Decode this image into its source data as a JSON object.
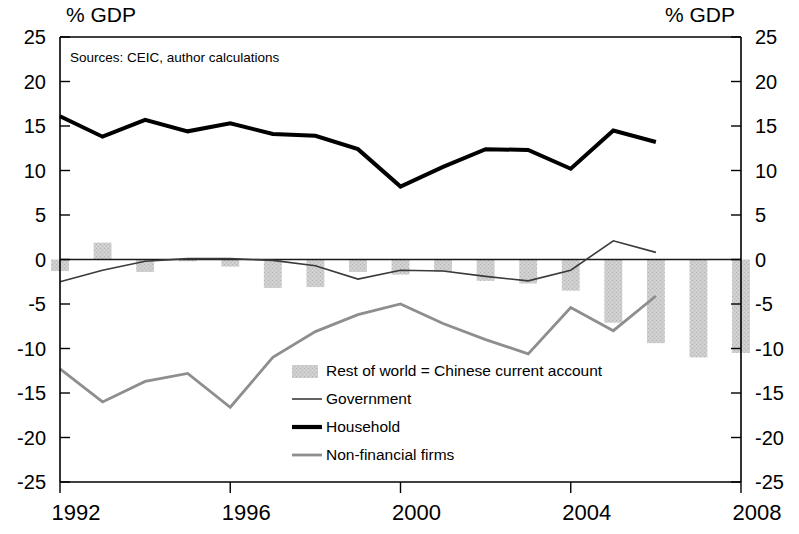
{
  "axis_titles": {
    "left": "% GDP",
    "right": "% GDP"
  },
  "source_note": "Sources: CEIC, author calculations",
  "y_ticks": [
    "25",
    "20",
    "15",
    "10",
    "5",
    "0",
    "-5",
    "-10",
    "-15",
    "-20",
    "-25"
  ],
  "x_ticks": [
    "1992",
    "1996",
    "2000",
    "2004",
    "2008"
  ],
  "legend": {
    "items": [
      {
        "label": "Rest of world = Chinese current account",
        "marker": "bar-swatch",
        "color": "#c9c9c9"
      },
      {
        "label": "Government",
        "marker": "thin-line",
        "color": "#3a3a3a"
      },
      {
        "label": "Household",
        "marker": "thick-line",
        "color": "#000000"
      },
      {
        "label": "Non-financial firms",
        "marker": "medium-line",
        "color": "#8e8e8e"
      }
    ]
  },
  "colors": {
    "bar": "#c9c9c9",
    "government": "#3a3a3a",
    "household": "#000000",
    "nonfinancial": "#8e8e8e",
    "axis": "#000000"
  },
  "chart_data": {
    "type": "bar",
    "title": "",
    "subtitle": "",
    "xlabel": "",
    "ylabel": "% GDP",
    "ylim": [
      -25,
      25
    ],
    "xlim": [
      1992,
      2008
    ],
    "ytick_step": 5,
    "grid": false,
    "legend_position": "center-bottom-inside",
    "x": [
      1992,
      1993,
      1994,
      1995,
      1996,
      1997,
      1998,
      1999,
      2000,
      2001,
      2002,
      2003,
      2004,
      2005,
      2006,
      2007,
      2008
    ],
    "series": [
      {
        "name": "Rest of world = Chinese current account",
        "type": "bar",
        "values": [
          -1.3,
          1.9,
          -1.4,
          -0.2,
          -0.8,
          -3.2,
          -3.1,
          -1.4,
          -1.7,
          -1.4,
          -2.4,
          -2.7,
          -3.5,
          -7.1,
          -9.4,
          -11.0,
          -10.5
        ]
      },
      {
        "name": "Government",
        "type": "line",
        "values": [
          -2.5,
          -1.2,
          -0.2,
          0.1,
          0.1,
          -0.1,
          -0.7,
          -2.2,
          -1.2,
          -1.3,
          -1.9,
          -2.4,
          -1.2,
          2.1,
          0.8,
          null,
          null
        ]
      },
      {
        "name": "Household",
        "type": "line",
        "values": [
          16.1,
          13.8,
          15.7,
          14.4,
          15.3,
          14.1,
          13.9,
          12.4,
          8.2,
          10.4,
          12.4,
          12.3,
          10.2,
          14.5,
          13.2,
          null,
          null
        ]
      },
      {
        "name": "Non-financial firms",
        "type": "line",
        "values": [
          -12.3,
          -16.0,
          -13.7,
          -12.8,
          -16.6,
          -11.0,
          -8.1,
          -6.2,
          -5.0,
          -7.2,
          -9.0,
          -10.6,
          -5.4,
          -8.0,
          -4.1,
          null,
          null
        ]
      }
    ]
  }
}
